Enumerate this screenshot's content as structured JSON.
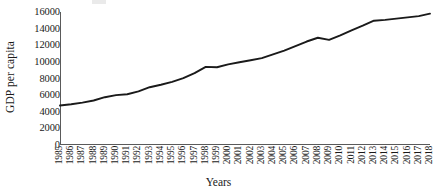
{
  "chart_data": {
    "type": "line",
    "title": "",
    "xlabel": "Years",
    "ylabel": "GDP per capita",
    "x": [
      1985,
      1986,
      1987,
      1988,
      1989,
      1990,
      1991,
      1992,
      1993,
      1994,
      1995,
      1996,
      1997,
      1998,
      1999,
      2000,
      2001,
      2002,
      2003,
      2004,
      2005,
      2006,
      2007,
      2008,
      2009,
      2010,
      2011,
      2012,
      2013,
      2014,
      2015,
      2016,
      2017,
      2018
    ],
    "categories": [
      "1985",
      "1986",
      "1987",
      "1988",
      "1989",
      "1990",
      "1991",
      "1992",
      "1993",
      "1994",
      "1995",
      "1996",
      "1997",
      "1998",
      "1999",
      "2000",
      "2001",
      "2002",
      "2003",
      "2004",
      "2005",
      "2006",
      "2007",
      "2008",
      "2009",
      "2010",
      "2011",
      "2012",
      "2013",
      "2014",
      "2015",
      "2016",
      "2017",
      "2018"
    ],
    "values": [
      4750,
      4900,
      5100,
      5350,
      5750,
      6000,
      6100,
      6450,
      6950,
      7250,
      7600,
      8050,
      8650,
      9400,
      9350,
      9700,
      9950,
      10200,
      10450,
      10900,
      11350,
      11900,
      12450,
      12900,
      12650,
      13200,
      13800,
      14350,
      14950,
      15050,
      15200,
      15350,
      15500,
      15800
    ],
    "series": [
      {
        "name": "GDP per capita",
        "color": "#1a1a1a",
        "values": [
          4750,
          4900,
          5100,
          5350,
          5750,
          6000,
          6100,
          6450,
          6950,
          7250,
          7600,
          8050,
          8650,
          9400,
          9350,
          9700,
          9950,
          10200,
          10450,
          10900,
          11350,
          11900,
          12450,
          12900,
          12650,
          13200,
          13800,
          14350,
          14950,
          15050,
          15200,
          15350,
          15500,
          15800
        ]
      }
    ],
    "ylim": [
      0,
      16000
    ],
    "yticks": [
      0,
      2000,
      4000,
      6000,
      8000,
      10000,
      12000,
      14000,
      16000
    ],
    "ytick_labels": [
      "0",
      "2000",
      "4000",
      "6000",
      "8000",
      "10000",
      "12000",
      "14000",
      "16000"
    ],
    "xlim": [
      1985,
      2018
    ],
    "grid": false,
    "legend": false,
    "legend_position": "none",
    "line_color": "#1a1a1a",
    "axis_color": "#5a5a5a",
    "background": "#ffffff",
    "markers": false,
    "xtick_rotation": -90
  }
}
